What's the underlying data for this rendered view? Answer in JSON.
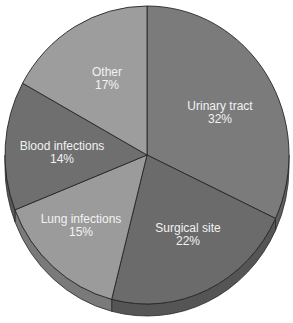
{
  "chart_data": {
    "type": "pie",
    "title": "",
    "categories": [
      "Urinary tract",
      "Surgical site",
      "Lung infections",
      "Blood infections",
      "Other"
    ],
    "values": [
      32,
      22,
      15,
      14,
      17
    ],
    "unit": "%",
    "labels": [
      {
        "name": "Urinary tract",
        "pct": "32%"
      },
      {
        "name": "Surgical site",
        "pct": "22%"
      },
      {
        "name": "Lung infections",
        "pct": "15%"
      },
      {
        "name": "Blood infections",
        "pct": "14%"
      },
      {
        "name": "Other",
        "pct": "17%"
      }
    ],
    "colors": [
      "#7b7b7b",
      "#6b6b6b",
      "#9b9b9b",
      "#6f6f6f",
      "#9d9d9d"
    ],
    "side_colors": [
      "#5e5e5e",
      "#555555",
      "#7a7a7a",
      "#585858",
      "#7c7c7c"
    ],
    "legend": "none",
    "style": "3d-tilted pie with labels inside slices"
  }
}
